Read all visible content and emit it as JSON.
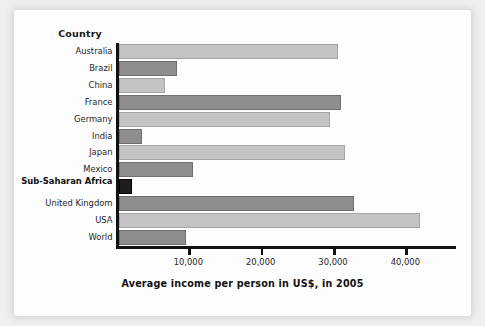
{
  "figure": {
    "column_header": "Country",
    "axis_title": "Average income per person in US$, in 2005"
  },
  "chart_data": {
    "type": "bar",
    "orientation": "horizontal",
    "title": "",
    "xlabel": "Average income per person in US$, in 2005",
    "ylabel": "Country",
    "xlim": [
      0,
      47000
    ],
    "xticks": [
      10000,
      20000,
      30000,
      40000
    ],
    "xtick_labels": [
      "10,000",
      "20,000",
      "30,000",
      "40,000"
    ],
    "grid": false,
    "legend": false,
    "categories": [
      "Australia",
      "Brazil",
      "China",
      "France",
      "Germany",
      "India",
      "Japan",
      "Mexico",
      "Sub-Saharan Africa",
      "United Kingdom",
      "USA",
      "World"
    ],
    "values": [
      30300,
      8050,
      6400,
      30700,
      29200,
      3300,
      31300,
      10300,
      1800,
      32600,
      41700,
      9300
    ],
    "bar_shades": [
      "light",
      "dark",
      "light",
      "dark",
      "light",
      "dark",
      "light",
      "dark",
      "black",
      "dark",
      "light",
      "dark"
    ],
    "colors": {
      "light_bar": "#c3c3c3",
      "dark_bar": "#8e8e8e",
      "black_bar": "#1d1d1d",
      "axis": "#111111",
      "panel_background": "#fdfdfd",
      "page_background": "#efefef"
    },
    "bars": [
      {
        "label": "Australia",
        "value": 30300,
        "shade": "light",
        "bold_label": false
      },
      {
        "label": "Brazil",
        "value": 8050,
        "shade": "dark",
        "bold_label": false
      },
      {
        "label": "China",
        "value": 6400,
        "shade": "light",
        "bold_label": false
      },
      {
        "label": "France",
        "value": 30700,
        "shade": "dark",
        "bold_label": false
      },
      {
        "label": "Germany",
        "value": 29200,
        "shade": "light",
        "bold_label": false
      },
      {
        "label": "India",
        "value": 3300,
        "shade": "dark",
        "bold_label": false
      },
      {
        "label": "Japan",
        "value": 31300,
        "shade": "light",
        "bold_label": false
      },
      {
        "label": "Mexico",
        "value": 10300,
        "shade": "dark",
        "bold_label": false
      },
      {
        "label": "Sub-Saharan Africa",
        "value": 1800,
        "shade": "black",
        "bold_label": true
      },
      {
        "label": "United Kingdom",
        "value": 32600,
        "shade": "dark",
        "bold_label": false
      },
      {
        "label": "USA",
        "value": 41700,
        "shade": "light",
        "bold_label": false
      },
      {
        "label": "World",
        "value": 9300,
        "shade": "dark",
        "bold_label": false
      }
    ]
  }
}
